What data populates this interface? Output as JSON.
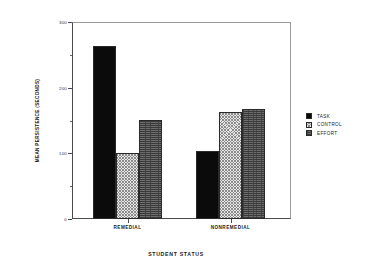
{
  "chart_data": {
    "type": "bar",
    "title": "",
    "xlabel": "STUDENT STATUS",
    "ylabel": "MEAN PERSISTENCE (SECONDS)",
    "categories": [
      "REMEDIAL",
      "NONREMEDIAL"
    ],
    "series": [
      {
        "name": "TASK",
        "values": [
          263,
          103
        ],
        "swatch": "solid-black",
        "color": "#0b0b0b"
      },
      {
        "name": "CONTROL",
        "values": [
          100,
          163
        ],
        "swatch": "light-hatch",
        "color": "#e4e4e4"
      },
      {
        "name": "EFFORT",
        "values": [
          151,
          168
        ],
        "swatch": "dark-hatch",
        "color": "#6d6d6d"
      }
    ],
    "ylim": [
      0,
      300
    ],
    "ytick_labels": [
      "0",
      "100",
      "200",
      "300"
    ],
    "ytick_values": [
      0,
      100,
      200,
      300
    ],
    "yminor_values": [
      50,
      150,
      250
    ],
    "grid": false,
    "legend_position": "right",
    "legend_entries": [
      "TASK",
      "CONTROL",
      "EFFORT"
    ]
  },
  "axes": {
    "y_title": "MEAN PERSISTENCE (SECONDS)",
    "x_title": "STUDENT STATUS",
    "y_ticks": [
      {
        "label": "300",
        "value": 300
      },
      {
        "label": "200",
        "value": 200
      },
      {
        "label": "100",
        "value": 100
      },
      {
        "label": "0",
        "value": 0
      }
    ],
    "x_ticks": [
      {
        "label": "REMEDIAL"
      },
      {
        "label": "NONREMEDIAL"
      }
    ]
  },
  "legend": {
    "items": [
      {
        "label": "TASK"
      },
      {
        "label": "CONTROL"
      },
      {
        "label": "EFFORT"
      }
    ]
  }
}
